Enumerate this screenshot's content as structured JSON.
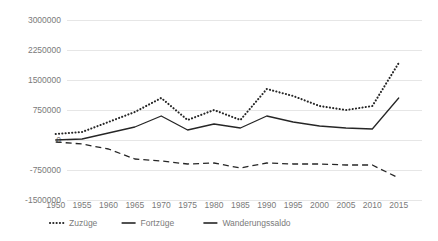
{
  "chart_data": {
    "type": "line",
    "title": "",
    "subtitle": "",
    "xlabel": "",
    "ylabel": "",
    "grid": true,
    "legend_position": "bottom",
    "x": [
      1950,
      1955,
      1960,
      1965,
      1970,
      1975,
      1980,
      1985,
      1990,
      1995,
      2000,
      2005,
      2010,
      2015
    ],
    "xtick_labels": [
      "1950",
      "1955",
      "1960",
      "1965",
      "1970",
      "1975",
      "1980",
      "1985",
      "1990",
      "1995",
      "2000",
      "2005",
      "2010",
      "2015"
    ],
    "ytick_labels": [
      "3000000",
      "2250000",
      "1500000",
      "750000",
      "0",
      "-750000",
      "-1500000"
    ],
    "ytick_values": [
      3000000,
      2250000,
      1500000,
      750000,
      0,
      -750000,
      -1500000
    ],
    "ylim": [
      -1500000,
      3000000
    ],
    "xlim": [
      1950,
      2015
    ],
    "series": [
      {
        "name": "Zuzüge",
        "style": "dotted",
        "color": "#262626",
        "values": [
          150000,
          200000,
          450000,
          700000,
          1050000,
          500000,
          750000,
          500000,
          1275000,
          1100000,
          850000,
          750000,
          850000,
          1925000
        ]
      },
      {
        "name": "Fortzüge",
        "style": "solid",
        "color": "#262626",
        "values": [
          0,
          25000,
          175000,
          325000,
          600000,
          250000,
          400000,
          300000,
          600000,
          450000,
          350000,
          300000,
          275000,
          1050000
        ]
      },
      {
        "name": "Wanderungssaldo",
        "style": "dashed",
        "color": "#262626",
        "values": [
          -50000,
          -100000,
          -225000,
          -475000,
          -525000,
          -600000,
          -575000,
          -700000,
          -575000,
          -600000,
          -600000,
          -625000,
          -625000,
          -950000
        ]
      }
    ]
  },
  "legend": {
    "items": [
      {
        "label": "Zuzüge",
        "style": "dotted"
      },
      {
        "label": "Fortzüge",
        "style": "solid"
      },
      {
        "label": "Wanderungssaldo",
        "style": "dashed"
      }
    ]
  }
}
